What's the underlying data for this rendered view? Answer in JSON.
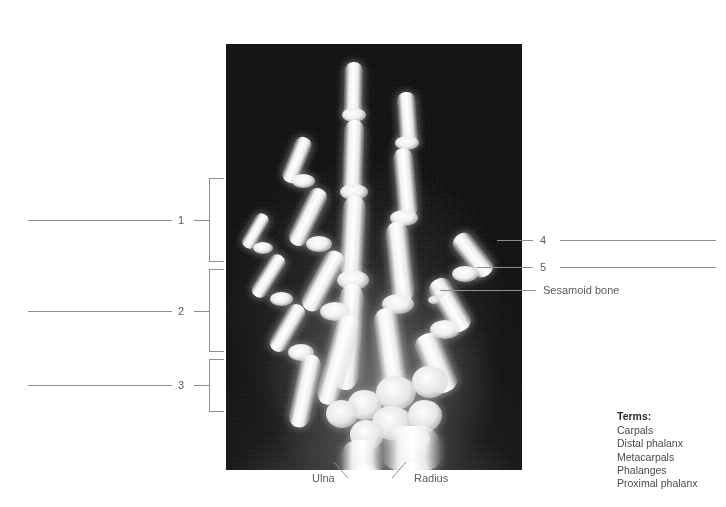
{
  "figure": {
    "type": "radiograph-labeling-exercise"
  },
  "left_labels": [
    {
      "number": "1",
      "answer_line": true
    },
    {
      "number": "2",
      "answer_line": true
    },
    {
      "number": "3",
      "answer_line": true
    }
  ],
  "right_labels": [
    {
      "number": "4",
      "answer_line": true
    },
    {
      "number": "5",
      "answer_line": true
    }
  ],
  "callouts": [
    {
      "text": "Sesamoid bone"
    }
  ],
  "bottom_callouts": [
    {
      "text": "Ulna"
    },
    {
      "text": "Radius"
    }
  ],
  "terms": {
    "title": "Terms:",
    "items": [
      "Carpals",
      "Distal phalanx",
      "Metacarpals",
      "Phalanges",
      "Proximal phalanx"
    ]
  },
  "colors": {
    "background": "#ffffff",
    "line": "#8e8e8e",
    "label_text": "#5b5b5b",
    "terms_text": "#4a4a4a",
    "terms_title": "#2b2b2b",
    "plate": "#0d0d0d"
  }
}
